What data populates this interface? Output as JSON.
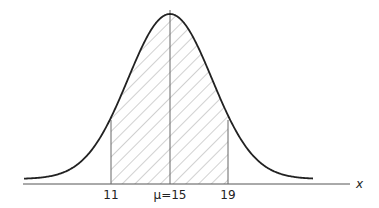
{
  "chart_data": {
    "type": "area",
    "title": "",
    "mean": 15,
    "shaded_interval": [
      11,
      19
    ],
    "xlabel": "x",
    "ylabel": "",
    "x_ticks": [
      "11",
      "μ=15",
      "19"
    ],
    "grid": false,
    "colors": {
      "curve": "#222222",
      "hatch": "#9a9a9a",
      "axis": "#555555"
    }
  },
  "labels": {
    "tick_left": "11",
    "tick_mid": "μ=15",
    "tick_right": "19",
    "axis": "x"
  }
}
